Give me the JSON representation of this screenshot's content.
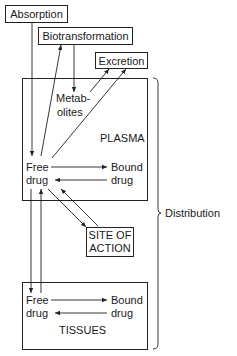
{
  "diagram": {
    "boxes": {
      "absorption": "Absorption",
      "biotransformation": "Biotransformation",
      "excretion": "Excretion",
      "site_of_action_line1": "SITE OF",
      "site_of_action_line2": "ACTION"
    },
    "plasma": {
      "title": "PLASMA",
      "metabolites_line1": "Metab-",
      "metabolites_line2": "olites",
      "free_line1": "Free",
      "free_line2": "drug",
      "bound_line1": "Bound",
      "bound_line2": "drug"
    },
    "tissues": {
      "title": "TISSUES",
      "free_line1": "Free",
      "free_line2": "drug",
      "bound_line1": "Bound",
      "bound_line2": "drug"
    },
    "brace_label": "Distribution",
    "colors": {
      "line": "#222222",
      "background": "#ffffff"
    }
  }
}
